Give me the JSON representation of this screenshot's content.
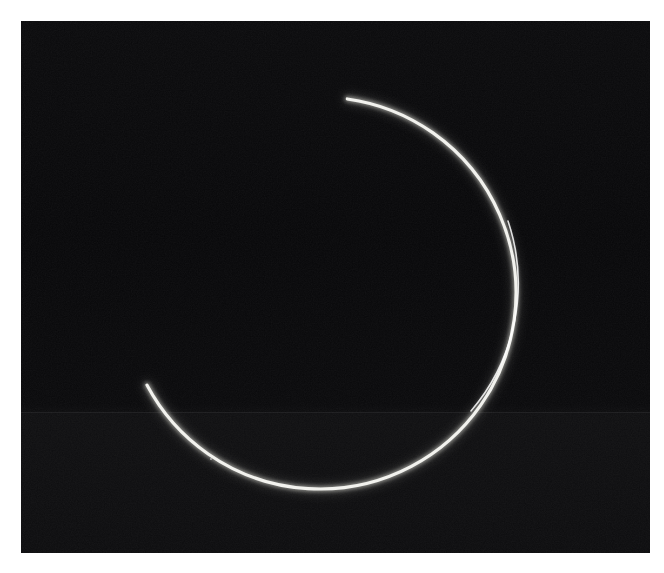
{
  "image": {
    "title": "Luminous crescent arc on dark field",
    "width_px": 664,
    "height_px": 573,
    "page_background": "#ffffff",
    "plate": {
      "left_px": 21,
      "top_px": 21,
      "width_px": 629,
      "height_px": 532,
      "background": "#030303",
      "description": "Dark photographic plate / astronomical style exposure"
    },
    "seam": {
      "present": true,
      "y_px": 412,
      "note": "faint horizontal scan band across the plate"
    }
  },
  "subject": {
    "name": "crescent-arc",
    "shape": "open circular arc",
    "opening_direction": "left",
    "stroke_color": "#f2f2ee",
    "glow_color": "#8a8a84",
    "center_x_px": 320,
    "center_y_px": 293,
    "radius_px": 196,
    "start_angle_deg": -82,
    "end_angle_deg": 152,
    "sweep_deg": 234,
    "max_thickness_px": 6.0,
    "tip_thickness_px": 1.4,
    "endpoints": {
      "top_tip": {
        "x_px": 390,
        "y_px": 99
      },
      "bottom_tip": {
        "x_px": 226,
        "y_px": 467
      }
    },
    "extrema": {
      "rightmost": {
        "x_px": 516,
        "y_px": 297
      },
      "lowest": {
        "x_px": 332,
        "y_px": 484
      }
    }
  },
  "speck": {
    "name": "bright-speck",
    "x_px": 210,
    "y_px": 458,
    "diameter_px": 2,
    "color": "#cfcfcf"
  },
  "palette": {
    "page": "#ffffff",
    "plate_dark": "#030303",
    "arc_bright": "#f2f2ee",
    "arc_glow": "#8a8a84",
    "seam": "#787a7d"
  }
}
